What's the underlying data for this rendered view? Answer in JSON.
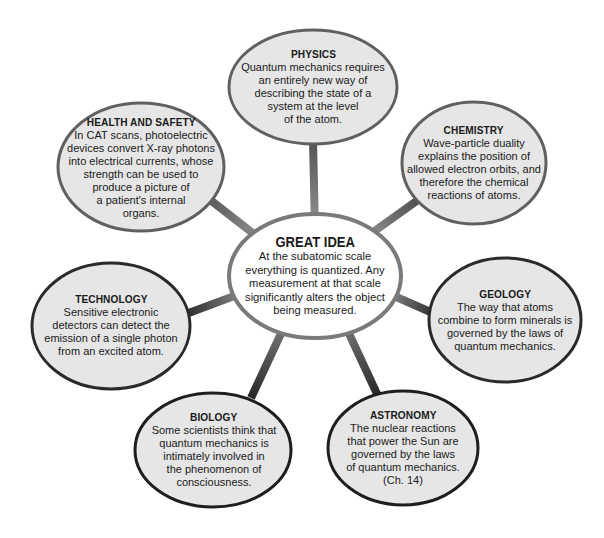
{
  "diagram": {
    "colors": {
      "background": "#ffffff",
      "bubble_fill": "#e6e6e6",
      "bubble_border": "#2a2a2a",
      "center_fill": "#ffffff",
      "center_border": "#7a7a7a",
      "connector_inner": "#8a8a8a",
      "connector_outer": "#3a3a3a",
      "text": "#1a1a1a"
    },
    "center": {
      "title": "GREAT IDEA",
      "body": "At the subatomic scale\neverything is quantized.  Any\nmeasurement at that scale\nsignificantly alters the object\nbeing measured."
    },
    "nodes": [
      {
        "id": "physics",
        "title": "PHYSICS",
        "body": "Quantum mechanics requires\nan entirely new way of\ndescribing the state of a\nsystem at the level\nof the atom."
      },
      {
        "id": "chemistry",
        "title": "CHEMISTRY",
        "body": "Wave-particle duality\nexplains the position of\nallowed electron orbits, and\ntherefore the chemical\nreactions of atoms."
      },
      {
        "id": "geology",
        "title": "GEOLOGY",
        "body": "The way that atoms\ncombine to form minerals is\ngoverned by the laws of\nquantum mechanics."
      },
      {
        "id": "astronomy",
        "title": "ASTRONOMY",
        "body": "The nuclear reactions\nthat power the Sun are\ngoverned by the laws\nof quantum mechanics.\n(Ch. 14)"
      },
      {
        "id": "biology",
        "title": "BIOLOGY",
        "body": "Some scientists think that\nquantum mechanics is\nintimately involved in\nthe phenomenon of\nconsciousness."
      },
      {
        "id": "technology",
        "title": "TECHNOLOGY",
        "body": "Sensitive electronic\ndetectors can detect the\nemission of a single photon\nfrom an excited atom."
      },
      {
        "id": "health-and-safety",
        "title": "HEALTH AND SAFETY",
        "body": "In CAT scans, photoelectric\ndevices convert X-ray photons\ninto electrical currents, whose\nstrength can be used to\nproduce a picture of\na patient's internal\norgans."
      }
    ]
  }
}
